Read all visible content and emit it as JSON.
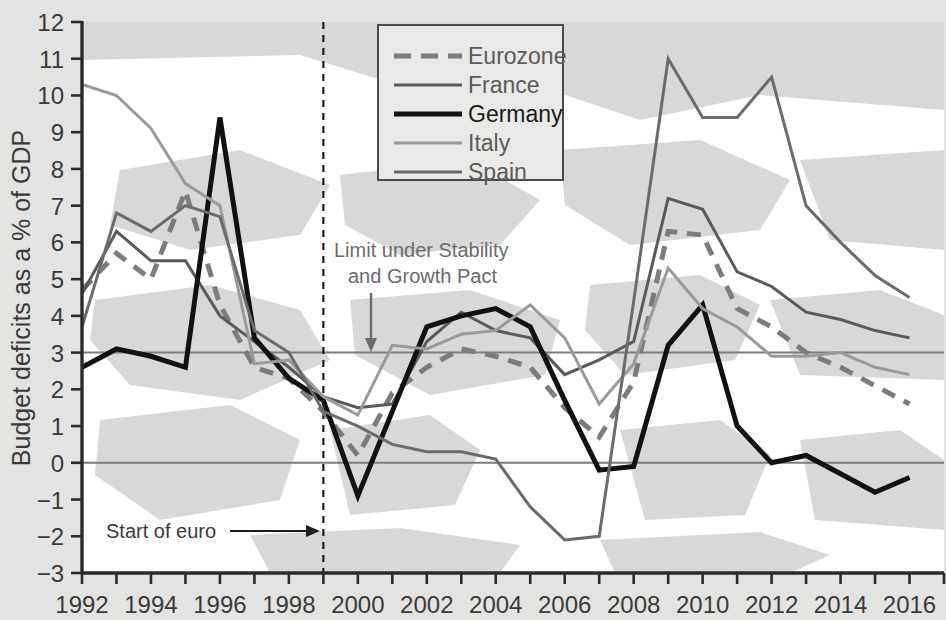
{
  "figure": {
    "background_color": "#e3e3e1",
    "plot_background_color": "#ffffff",
    "map_tint_color": "#d6d6d4",
    "axis_color": "#2b2b2b"
  },
  "chart_data": {
    "type": "line",
    "title": "",
    "xlabel": "",
    "ylabel": "Budget deficits as a % of GDP",
    "xlim": [
      1992,
      2017
    ],
    "ylim": [
      -3,
      12
    ],
    "grid": "horizontal reference lines at 0 and 3",
    "legend_position": "top-center",
    "x": [
      1992,
      1993,
      1994,
      1995,
      1996,
      1997,
      1998,
      1999,
      2000,
      2001,
      2002,
      2003,
      2004,
      2005,
      2006,
      2007,
      2008,
      2009,
      2010,
      2011,
      2012,
      2013,
      2014,
      2015,
      2016
    ],
    "series": [
      {
        "name": "Eurozone",
        "color": "#7c7c7c",
        "width": 5,
        "dash": "14 10",
        "values": [
          4.7,
          5.7,
          5.0,
          7.4,
          4.3,
          2.6,
          2.3,
          1.4,
          0.2,
          1.9,
          2.6,
          3.1,
          2.9,
          2.6,
          1.5,
          0.7,
          2.2,
          6.3,
          6.2,
          4.2,
          3.7,
          3.0,
          2.6,
          2.1,
          1.6
        ]
      },
      {
        "name": "France",
        "color": "#5a5a5a",
        "width": 3,
        "dash": "none",
        "values": [
          4.6,
          6.3,
          5.5,
          5.5,
          4.0,
          3.3,
          2.6,
          1.8,
          1.5,
          1.6,
          3.3,
          4.1,
          3.6,
          3.4,
          2.4,
          2.8,
          3.3,
          7.2,
          6.9,
          5.2,
          4.8,
          4.1,
          3.9,
          3.6,
          3.4
        ]
      },
      {
        "name": "Germany",
        "color": "#111111",
        "width": 5,
        "dash": "none",
        "values": [
          2.6,
          3.1,
          2.9,
          2.6,
          9.4,
          3.4,
          2.3,
          1.7,
          -0.9,
          1.4,
          3.7,
          4.0,
          4.2,
          3.7,
          1.7,
          -0.2,
          -0.1,
          3.2,
          4.3,
          1.0,
          0.0,
          0.2,
          -0.3,
          -0.8,
          -0.4
        ]
      },
      {
        "name": "Italy",
        "color": "#9a9a9a",
        "width": 3,
        "dash": "none",
        "values": [
          10.3,
          10.0,
          9.1,
          7.6,
          7.0,
          2.7,
          2.8,
          1.8,
          1.3,
          3.2,
          3.1,
          3.5,
          3.6,
          4.3,
          3.4,
          1.6,
          2.7,
          5.3,
          4.2,
          3.7,
          2.9,
          2.9,
          3.0,
          2.6,
          2.4
        ]
      },
      {
        "name": "Spain",
        "color": "#6b6b6b",
        "width": 3,
        "dash": "none",
        "values": [
          3.7,
          6.8,
          6.3,
          7.0,
          6.7,
          3.6,
          3.0,
          1.4,
          1.0,
          0.5,
          0.3,
          0.3,
          0.1,
          -1.2,
          -2.1,
          -2.0,
          4.4,
          11.0,
          9.4,
          9.4,
          10.5,
          7.0,
          6.0,
          5.1,
          4.5
        ]
      }
    ],
    "reference_lines": [
      {
        "value": 3,
        "label": "Limit under Stability and Growth Pact"
      },
      {
        "value": 0,
        "label": ""
      }
    ],
    "vertical_marker": {
      "x": 1999,
      "label": "Start of euro",
      "style": "dashed"
    },
    "ytick_labels": [
      "12",
      "11",
      "10",
      "9",
      "8",
      "7",
      "6",
      "5",
      "4",
      "3",
      "2",
      "1",
      "0",
      "−1",
      "−2",
      "−3"
    ],
    "ytick_values": [
      12,
      11,
      10,
      9,
      8,
      7,
      6,
      5,
      4,
      3,
      2,
      1,
      0,
      -1,
      -2,
      -3
    ],
    "xtick_labels": [
      "1992",
      "1994",
      "1996",
      "1998",
      "2000",
      "2002",
      "2004",
      "2006",
      "2008",
      "2010",
      "2012",
      "2014",
      "2016"
    ],
    "xtick_values": [
      1992,
      1994,
      1996,
      1998,
      2000,
      2002,
      2004,
      2006,
      2008,
      2010,
      2012,
      2014,
      2016
    ]
  },
  "annotations": {
    "limit_line_1": "Limit under Stability",
    "limit_line_2": "and Growth Pact",
    "euro_start": "Start of euro"
  },
  "legend": {
    "items": [
      {
        "label": "Eurozone",
        "color": "#7c7c7c",
        "dashed": true,
        "bold": false
      },
      {
        "label": "France",
        "color": "#5a5a5a",
        "dashed": false,
        "bold": false
      },
      {
        "label": "Germany",
        "color": "#111111",
        "dashed": false,
        "bold": true
      },
      {
        "label": "Italy",
        "color": "#9a9a9a",
        "dashed": false,
        "bold": false
      },
      {
        "label": "Spain",
        "color": "#6b6b6b",
        "dashed": false,
        "bold": false
      }
    ]
  },
  "axis": {
    "y_title": "Budget deficits as a % of GDP"
  }
}
